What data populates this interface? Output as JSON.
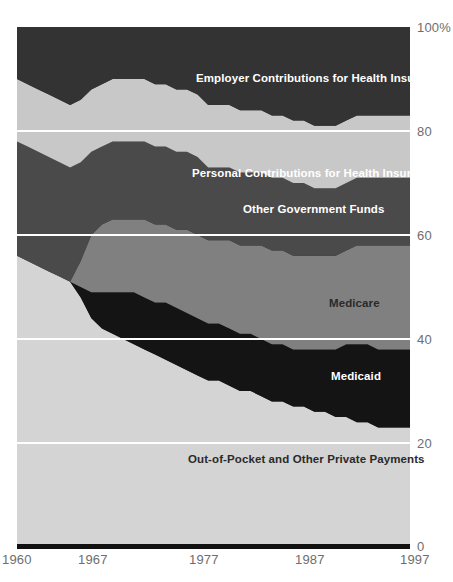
{
  "chart_data": {
    "type": "area",
    "title": "",
    "subtitle": "",
    "xlabel": "",
    "ylabel": "",
    "stacked": true,
    "normalized_percent": true,
    "grid": true,
    "legend_position": "inline-labels",
    "xlim": [
      1960,
      1997
    ],
    "ylim": [
      0,
      100
    ],
    "x_tick_labels": [
      "1960",
      "1967",
      "1977",
      "1987",
      "1997"
    ],
    "x_ticks": [
      1960,
      1967,
      1977,
      1987,
      1997
    ],
    "y_tick_labels": [
      "100%",
      "80",
      "60",
      "40",
      "20",
      "0"
    ],
    "y_ticks": [
      100,
      80,
      60,
      40,
      20,
      0
    ],
    "x": [
      1960,
      1961,
      1962,
      1963,
      1964,
      1965,
      1966,
      1967,
      1968,
      1969,
      1970,
      1971,
      1972,
      1973,
      1974,
      1975,
      1976,
      1977,
      1978,
      1979,
      1980,
      1981,
      1982,
      1983,
      1984,
      1985,
      1986,
      1987,
      1988,
      1989,
      1990,
      1991,
      1992,
      1993,
      1994,
      1995,
      1996,
      1997
    ],
    "series": [
      {
        "name": "Out-of-Pocket and Other Private Payments",
        "color": "#d4d4d4",
        "label_color": "#2a2a2a",
        "values": [
          56,
          55,
          54,
          53,
          52,
          51,
          48,
          44,
          42,
          41,
          40,
          39,
          38,
          37,
          36,
          35,
          34,
          33,
          32,
          32,
          31,
          30,
          30,
          29,
          28,
          28,
          27,
          27,
          26,
          26,
          25,
          25,
          24,
          24,
          23,
          23,
          23,
          23
        ]
      },
      {
        "name": "Medicaid",
        "color": "#141414",
        "label_color": "#ffffff",
        "values": [
          0,
          0,
          0,
          0,
          0,
          0,
          2,
          5,
          7,
          8,
          9,
          10,
          10,
          10,
          11,
          11,
          11,
          11,
          11,
          11,
          11,
          11,
          11,
          11,
          11,
          11,
          11,
          11,
          12,
          12,
          13,
          14,
          15,
          15,
          15,
          15,
          15,
          15
        ]
      },
      {
        "name": "Medicare",
        "color": "#808080",
        "label_color": "#2a2a2a",
        "values": [
          0,
          0,
          0,
          0,
          0,
          0,
          5,
          11,
          13,
          14,
          14,
          14,
          15,
          15,
          15,
          15,
          16,
          16,
          16,
          16,
          17,
          17,
          17,
          18,
          18,
          18,
          18,
          18,
          18,
          18,
          18,
          18,
          19,
          19,
          20,
          20,
          20,
          20
        ]
      },
      {
        "name": "Other Government Funds",
        "color": "#4a4a4a",
        "label_color": "#ffffff",
        "values": [
          22,
          22,
          22,
          22,
          22,
          22,
          19,
          16,
          15,
          15,
          15,
          15,
          15,
          15,
          15,
          15,
          15,
          15,
          14,
          14,
          14,
          14,
          14,
          14,
          14,
          14,
          14,
          14,
          13,
          13,
          13,
          13,
          13,
          13,
          13,
          13,
          13,
          13
        ]
      },
      {
        "name": "Personal Contributions for Health Insurance",
        "color": "#c8c8c8",
        "label_color": "#2a2a2a",
        "values": [
          12,
          12,
          12,
          12,
          12,
          12,
          12,
          12,
          12,
          12,
          12,
          12,
          12,
          12,
          12,
          12,
          12,
          12,
          12,
          12,
          12,
          12,
          12,
          12,
          12,
          12,
          12,
          12,
          12,
          12,
          12,
          12,
          12,
          12,
          12,
          12,
          12,
          12
        ]
      },
      {
        "name": "Employer Contributions for Health Insurance",
        "color": "#333333",
        "label_color": "#ffffff",
        "values": [
          10,
          11,
          12,
          13,
          14,
          15,
          14,
          12,
          11,
          10,
          10,
          10,
          10,
          11,
          11,
          12,
          12,
          13,
          15,
          15,
          15,
          16,
          16,
          16,
          17,
          17,
          18,
          18,
          19,
          19,
          19,
          18,
          17,
          17,
          17,
          17,
          17,
          17
        ]
      }
    ],
    "inline_labels": [
      {
        "text": "Employer Contributions for Health Insurance",
        "x_px": 196,
        "y_px": 72,
        "tone": "light"
      },
      {
        "text": "Personal Contributions for Health Insurance",
        "x_px": 192,
        "y_px": 167,
        "tone": "light"
      },
      {
        "text": "Other Government Funds",
        "x_px": 243,
        "y_px": 203,
        "tone": "light"
      },
      {
        "text": "Medicare",
        "x_px": 329,
        "y_px": 297,
        "tone": "dark"
      },
      {
        "text": "Medicaid",
        "x_px": 331,
        "y_px": 370,
        "tone": "light"
      },
      {
        "text": "Out-of-Pocket and Other Private Payments",
        "x_px": 188,
        "y_px": 453,
        "tone": "dark"
      }
    ],
    "gridline_color": "#ffffff",
    "baseline_color": "#111111",
    "axis_text_color": "#6e6e6e"
  }
}
